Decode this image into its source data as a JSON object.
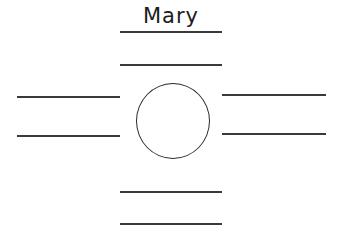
{
  "diagram": {
    "title": "Mary",
    "center_shape": "circle",
    "lines": {
      "top": [
        "",
        ""
      ],
      "left": [
        "",
        ""
      ],
      "right": [
        "",
        ""
      ],
      "bottom": [
        "",
        ""
      ]
    },
    "colors": {
      "stroke": "#3a3a3a",
      "background": "#ffffff"
    }
  }
}
